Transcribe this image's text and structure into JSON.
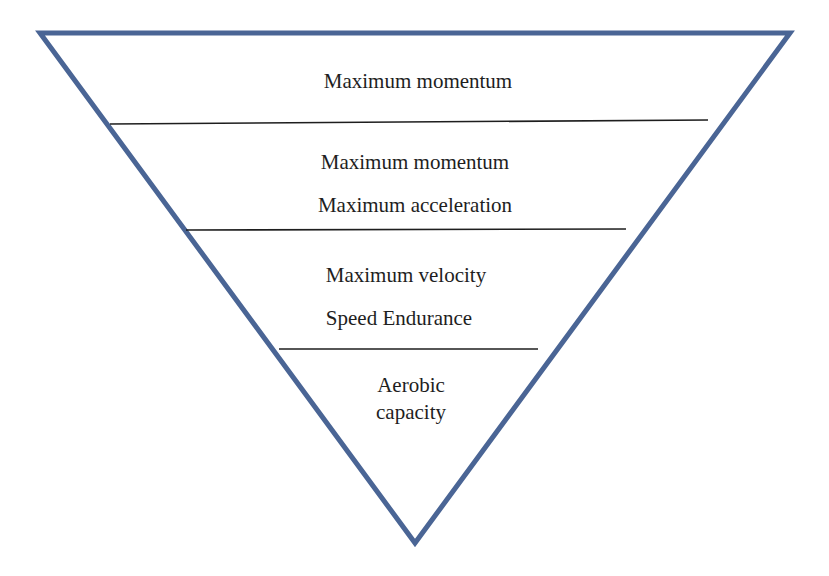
{
  "diagram": {
    "type": "inverted-pyramid",
    "outline_color": "#4a6595",
    "divider_color": "#1e1e1e",
    "triangle": {
      "top_left": [
        40,
        33
      ],
      "top_right": [
        790,
        33
      ],
      "bottom": [
        415,
        543
      ]
    },
    "tiers": [
      {
        "lines": [
          "Maximum momentum"
        ],
        "label_positions": [
          [
            418,
            87
          ]
        ]
      },
      {
        "lines": [
          "Maximum momentum",
          "Maximum acceleration"
        ],
        "label_positions": [
          [
            415,
            168
          ],
          [
            415,
            211
          ]
        ]
      },
      {
        "lines": [
          "Maximum velocity",
          "Speed Endurance"
        ],
        "label_positions": [
          [
            406,
            281
          ],
          [
            399,
            324
          ]
        ]
      },
      {
        "lines": [
          "Aerobic",
          "capacity"
        ],
        "label_positions": [
          [
            411,
            391
          ],
          [
            411,
            418
          ]
        ]
      }
    ],
    "dividers": [
      {
        "x1": 110,
        "y1": 124,
        "x2": 708,
        "y2": 120
      },
      {
        "x1": 186,
        "y1": 230,
        "x2": 626,
        "y2": 229
      },
      {
        "x1": 279,
        "y1": 349,
        "x2": 538,
        "y2": 349
      }
    ]
  }
}
